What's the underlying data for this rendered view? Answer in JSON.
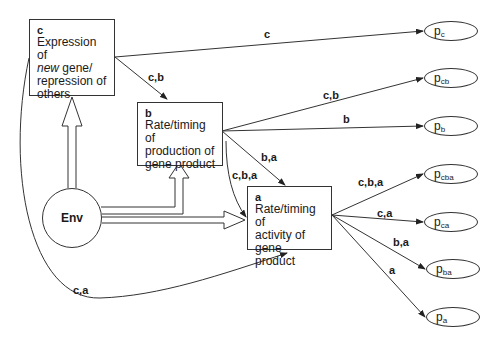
{
  "boxes": {
    "c": {
      "tag": "c",
      "line1": "Expression of",
      "line2_italic": "new",
      "line2_rest": " gene/",
      "line3": "repression of",
      "line4": "others"
    },
    "b": {
      "tag": "b",
      "line1": "Rate/timing of",
      "line2": "production of",
      "line3": "gene product"
    },
    "a": {
      "tag": "a",
      "line1": "Rate/timing of",
      "line2": "activity of gene",
      "line3": "product"
    }
  },
  "env": {
    "label": "Env"
  },
  "edges": [
    {
      "from": "c",
      "to": "p_c",
      "label": "c"
    },
    {
      "from": "c",
      "to": "b",
      "label": "c,b"
    },
    {
      "from": "b",
      "to": "p_cb",
      "label": "c,b"
    },
    {
      "from": "b",
      "to": "p_b",
      "label": "b"
    },
    {
      "from": "b",
      "to": "a",
      "label": "b,a"
    },
    {
      "from": "c",
      "to": "a",
      "label": "c,b,a",
      "via": "b"
    },
    {
      "from": "c",
      "to": "a",
      "label": "c,a"
    },
    {
      "from": "a",
      "to": "p_cba",
      "label": "c,b,a"
    },
    {
      "from": "a",
      "to": "p_ca",
      "label": "c,a"
    },
    {
      "from": "a",
      "to": "p_ba",
      "label": "b,a"
    },
    {
      "from": "a",
      "to": "p_a",
      "label": "a"
    }
  ],
  "env_arrows": [
    {
      "from": "Env",
      "to": "c"
    },
    {
      "from": "Env",
      "to": "b"
    },
    {
      "from": "Env",
      "to": "a"
    }
  ],
  "outcomes": [
    {
      "id": "p_c",
      "base": "p",
      "sub": "c"
    },
    {
      "id": "p_cb",
      "base": "p",
      "sub": "cb"
    },
    {
      "id": "p_b",
      "base": "p",
      "sub": "b"
    },
    {
      "id": "p_cba",
      "base": "p",
      "sub": "cba"
    },
    {
      "id": "p_ca",
      "base": "p",
      "sub": "ca"
    },
    {
      "id": "p_ba",
      "base": "p",
      "sub": "ba"
    },
    {
      "id": "p_a",
      "base": "p",
      "sub": "a"
    }
  ],
  "labels": {
    "c_to_pc": "c",
    "c_to_b": "c,b",
    "b_to_pcb": "c,b",
    "b_to_pb": "b",
    "b_to_a": "b,a",
    "cba_curve": "c,b,a",
    "ca_curve": "c,a",
    "a_to_pcba": "c,b,a",
    "a_to_pca": "c,a",
    "a_to_pba": "b,a",
    "a_to_pa": "a"
  }
}
